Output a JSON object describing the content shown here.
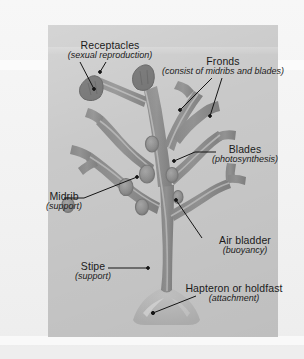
{
  "figure": {
    "plate_background_color": "#c9c9c9",
    "page_background_color": "#f2f2f2",
    "thallus_color": "#8e8e8e",
    "thallus_shadow_color": "#7b7b7b",
    "midrib_color": "#b4b4b4",
    "receptacle_color": "#6f6f6f",
    "holdfast_color": "#bdbdbd",
    "text_color": "#1b1b1b",
    "leader_line_color": "#151515"
  },
  "labels": {
    "receptacles": {
      "title": "Receptacles",
      "subtitle": "(sexual reproduction)"
    },
    "fronds": {
      "title": "Fronds",
      "subtitle": "(consist of midribs and blades)"
    },
    "blades": {
      "title": "Blades",
      "subtitle": "(photosynthesis)"
    },
    "midrib": {
      "title": "Midrib",
      "subtitle": "(support)"
    },
    "air_bladder": {
      "title": "Air bladder",
      "subtitle": "(buoyancy)"
    },
    "stipe": {
      "title": "Stipe",
      "subtitle": "(support)"
    },
    "hapteron": {
      "title": "Hapteron or holdfast",
      "subtitle": "(attachment)"
    }
  }
}
